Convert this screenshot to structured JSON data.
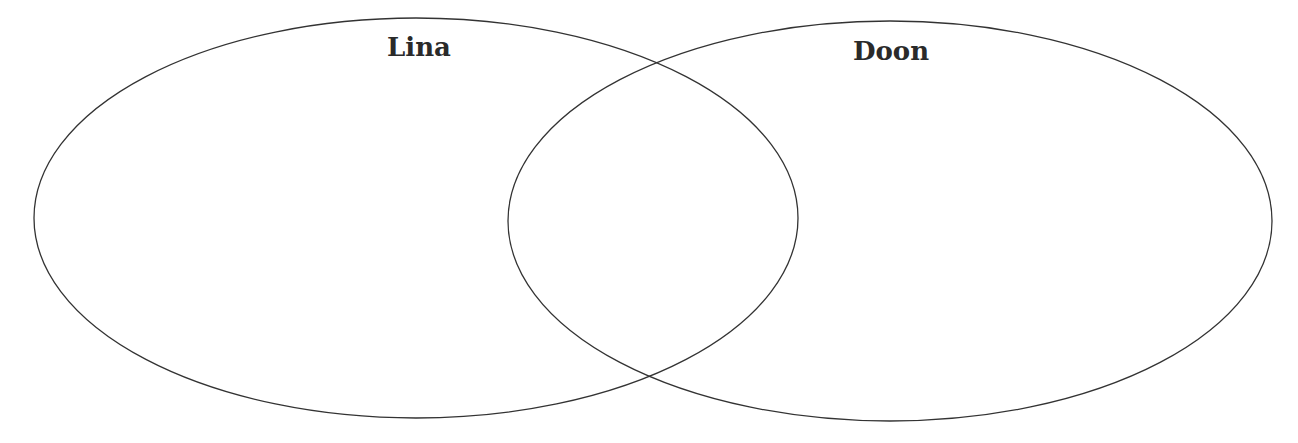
{
  "diagram": {
    "type": "venn",
    "stroke_color": "#333333",
    "background_color": "#ffffff",
    "sets": [
      {
        "label": "Lina",
        "cx": 416,
        "cy": 218,
        "rx": 382,
        "ry": 200,
        "label_x": 419,
        "label_y": 56
      },
      {
        "label": "Doon",
        "cx": 890,
        "cy": 221,
        "rx": 382,
        "ry": 200,
        "label_x": 891,
        "label_y": 60
      }
    ],
    "regions": {
      "left_only": "",
      "overlap": "",
      "right_only": ""
    }
  }
}
